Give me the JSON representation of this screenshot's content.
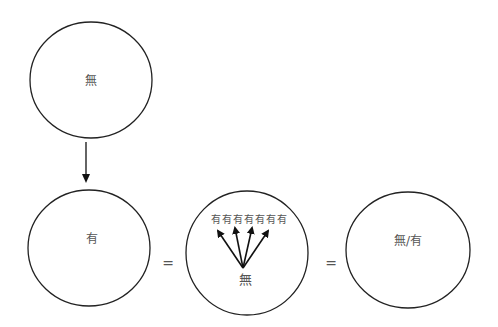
{
  "diagram": {
    "top_circle": {
      "label": "無"
    },
    "bottom_left_circle": {
      "label": "有"
    },
    "equals_1": "=",
    "middle_circle": {
      "top_row": [
        "有",
        "有",
        "有",
        "有",
        "有",
        "有",
        "有"
      ],
      "bottom_label": "無",
      "arrow_count": 4
    },
    "equals_2": "=",
    "right_circle": {
      "label": "無/有"
    }
  },
  "colors": {
    "stroke": "#222222",
    "text": "#555555",
    "background": "#ffffff"
  }
}
